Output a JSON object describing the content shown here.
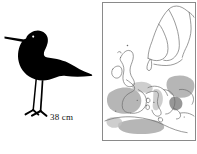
{
  "plate": {
    "width_px": 197,
    "height_px": 154,
    "background_color": "#ffffff"
  },
  "bird_panel": {
    "figure_name": "wader-bird-silhouette",
    "silhouette_color": "#000000",
    "size_label": "38 cm",
    "description": "black wader bird silhouette facing left with long straight bill, long thin legs and pointed tail"
  },
  "map_panel": {
    "title": "distribution-map-of-europe",
    "frame_color": "#8a8a8a",
    "land_outline_color": "#6b6b6b",
    "range_color": "#a9a9a9",
    "range_color_dark": "#8c8c8c",
    "range_color_light": "#c2c2c2",
    "regions_outlined": [
      "Scandinavia",
      "Finland",
      "Baltic",
      "British Isles",
      "Iberian Peninsula",
      "France",
      "Italy",
      "Balkans",
      "North Africa"
    ],
    "shaded_range_regions": [
      "Iberian Peninsula",
      "Southern France",
      "Italy",
      "Balkans / Black Sea",
      "North Africa coast"
    ]
  }
}
